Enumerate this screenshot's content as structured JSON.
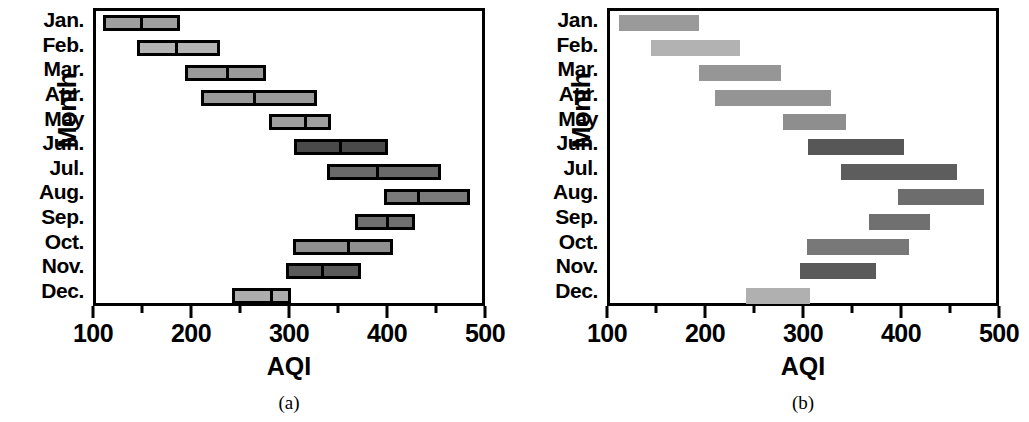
{
  "figure": {
    "panels": [
      {
        "id": "a",
        "caption": "(a)",
        "xlabel": "AQI",
        "ylabel": "Month",
        "style": "outlined-with-median"
      },
      {
        "id": "b",
        "caption": "(b)",
        "xlabel": "AQI",
        "ylabel": "Month",
        "style": "filled-flat"
      }
    ],
    "xticks": [
      "100",
      "200",
      "300",
      "400",
      "500"
    ],
    "months": [
      "Jan.",
      "Feb.",
      "Mar.",
      "Apr.",
      "May",
      "Jun.",
      "Jul.",
      "Aug.",
      "Sep.",
      "Oct.",
      "Nov.",
      "Dec."
    ]
  },
  "chart_data": [
    {
      "type": "bar",
      "subtype": "horizontal-range-bar",
      "panel": "a",
      "title": "",
      "caption": "(a)",
      "xlabel": "AQI",
      "ylabel": "Month",
      "xlim": [
        100,
        500
      ],
      "xticks": [
        100,
        200,
        300,
        400,
        500
      ],
      "minor_xticks": [
        150,
        250,
        350,
        450
      ],
      "grid": false,
      "legend": null,
      "categories": [
        "Jan.",
        "Feb.",
        "Mar.",
        "Apr.",
        "May",
        "Jun.",
        "Jul.",
        "Aug.",
        "Sep.",
        "Oct.",
        "Nov.",
        "Dec."
      ],
      "series": [
        {
          "name": "AQI range (low, median, high)",
          "low": [
            107,
            142,
            191,
            207,
            277,
            302,
            336,
            394,
            364,
            301,
            294,
            239
          ],
          "median": [
            145,
            181,
            233,
            260,
            312,
            348,
            386,
            428,
            396,
            356,
            330,
            278
          ],
          "high": [
            186,
            227,
            273,
            326,
            340,
            398,
            452,
            482,
            426,
            403,
            370,
            299
          ]
        }
      ],
      "bar_colors": [
        "#9f9f9f",
        "#b4b4b4",
        "#9a9a9a",
        "#9a9a9a",
        "#9f9f9f",
        "#4a4a4a",
        "#6a6a6a",
        "#7a7a7a",
        "#6f6f6f",
        "#8f8f8f",
        "#5a5a5a",
        "#adadad"
      ],
      "bar_edge_color": "#000000"
    },
    {
      "type": "bar",
      "subtype": "horizontal-range-bar",
      "panel": "b",
      "title": "",
      "caption": "(b)",
      "xlabel": "AQI",
      "ylabel": "Month",
      "xlim": [
        100,
        500
      ],
      "xticks": [
        100,
        200,
        300,
        400,
        500
      ],
      "minor_xticks": [
        150,
        250,
        350,
        450
      ],
      "grid": false,
      "legend": null,
      "categories": [
        "Jan.",
        "Feb.",
        "Mar.",
        "Apr.",
        "May",
        "Jun.",
        "Jul.",
        "Aug.",
        "Sep.",
        "Oct.",
        "Nov.",
        "Dec."
      ],
      "series": [
        {
          "name": "AQI range (low, high)",
          "low": [
            109,
            142,
            191,
            207,
            277,
            302,
            336,
            394,
            364,
            301,
            294,
            239
          ],
          "high": [
            191,
            233,
            274,
            326,
            341,
            400,
            454,
            482,
            427,
            405,
            371,
            304
          ]
        }
      ],
      "bar_colors": [
        "#9a9a9a",
        "#b2b2b2",
        "#969696",
        "#949494",
        "#8e8e8e",
        "#575757",
        "#5d5d5d",
        "#6d6d6d",
        "#707070",
        "#787878",
        "#5a5a5a",
        "#b0b0b0"
      ],
      "bar_edge_color": "none"
    }
  ]
}
